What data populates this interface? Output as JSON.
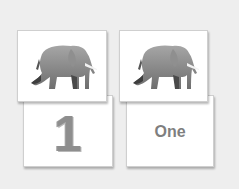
{
  "cards": [
    {
      "id": "picture-1",
      "type": "image",
      "icon": "elephant-icon",
      "alt": "elephant"
    },
    {
      "id": "picture-2",
      "type": "image",
      "icon": "elephant-icon",
      "alt": "elephant"
    },
    {
      "id": "numeral",
      "type": "text",
      "text": "1"
    },
    {
      "id": "word",
      "type": "text",
      "text": "One"
    }
  ],
  "colors": {
    "background": "#eeeeee",
    "card": "#ffffff",
    "text": "#7f7f7f"
  }
}
